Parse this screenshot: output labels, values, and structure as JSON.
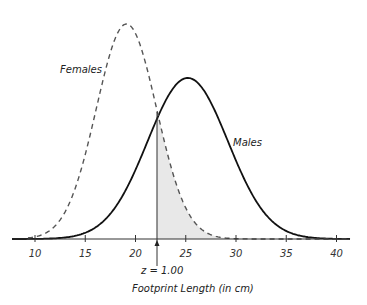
{
  "chart_data": {
    "type": "line",
    "title": "",
    "xlabel": "Footprint Length (in cm)",
    "ylabel": "",
    "xlim": [
      8.8,
      41.5
    ],
    "xticks": [
      10,
      15,
      20,
      25,
      30,
      35,
      40
    ],
    "grid": false,
    "legend": "inline labels",
    "series": [
      {
        "name": "Females",
        "distribution": "normal",
        "mean": 19.1,
        "sd": 3.0,
        "style": "dashed",
        "color": "#444444",
        "relative_peak_height": 215
      },
      {
        "name": "Males",
        "distribution": "normal",
        "mean": 25.2,
        "sd": 4.0,
        "style": "solid",
        "color": "#111111",
        "relative_peak_height": 161
      }
    ],
    "shaded_region": {
      "under": "Females",
      "from": 22.1,
      "to": "right tail",
      "color": "#e6e6e6"
    },
    "annotations": [
      {
        "text": "z = 1.00",
        "x": 22.1,
        "type": "vertical line with arrow"
      }
    ]
  },
  "labels": {
    "females": "Females",
    "males": "Males",
    "z_marker": "z = 1.00",
    "xlabel": "Footprint Length (in cm)",
    "ticks": [
      "10",
      "15",
      "20",
      "25",
      "30",
      "35",
      "40"
    ]
  }
}
